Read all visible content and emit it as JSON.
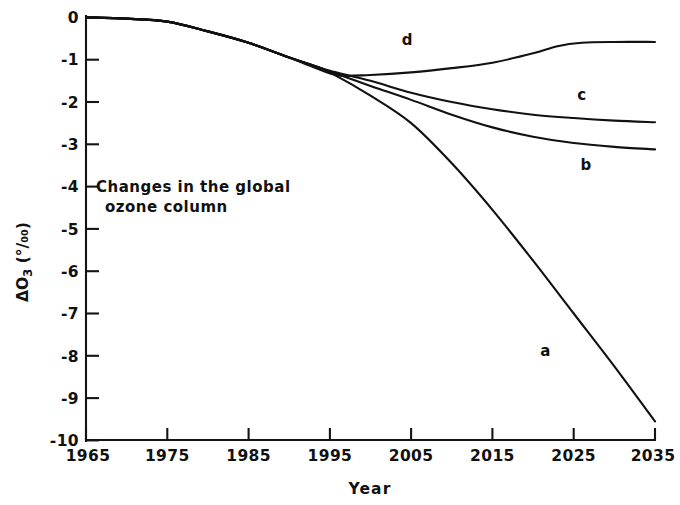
{
  "chart_data": {
    "type": "line",
    "title": "",
    "annotation": {
      "line1": "Changes in the global",
      "line2": "ozone column"
    },
    "xlabel": "Year",
    "ylabel": "ΔO3 (%)",
    "ylabel_parts": {
      "delta": "ΔO",
      "sub": "3",
      "unit": "(°/₀₀)",
      "unit_plain": "(%)"
    },
    "xlim": [
      1965,
      2035
    ],
    "ylim": [
      -10,
      0
    ],
    "xticks": [
      1965,
      1975,
      1985,
      1995,
      2005,
      2015,
      2025,
      2035
    ],
    "xtick_labels": [
      "1965",
      "1975",
      "1985",
      "1995",
      "2005",
      "2015",
      "2025",
      "2035"
    ],
    "yticks": [
      0,
      -1,
      -2,
      -3,
      -4,
      -5,
      -6,
      -7,
      -8,
      -9,
      -10
    ],
    "ytick_labels": [
      "0",
      "-1",
      "-2",
      "-3",
      "-4",
      "-5",
      "-6",
      "-7",
      "-8",
      "-9",
      "-10"
    ],
    "grid": false,
    "legend": "inline-curve-labels",
    "series": [
      {
        "name": "a",
        "label": "a",
        "label_x": 2021.5,
        "label_y": -8.0,
        "x": [
          1965,
          1970,
          1975,
          1980,
          1985,
          1990,
          1993,
          1995,
          2000,
          2005,
          2010,
          2015,
          2020,
          2025,
          2030,
          2035
        ],
        "y": [
          0.0,
          -0.03,
          -0.1,
          -0.33,
          -0.6,
          -0.95,
          -1.14,
          -1.3,
          -1.85,
          -2.5,
          -3.45,
          -4.55,
          -5.75,
          -7.0,
          -8.25,
          -9.55
        ]
      },
      {
        "name": "b",
        "label": "b",
        "label_x": 2026.5,
        "label_y": -3.6,
        "x": [
          1965,
          1970,
          1975,
          1980,
          1985,
          1990,
          1993,
          1995,
          2000,
          2005,
          2010,
          2015,
          2020,
          2025,
          2030,
          2035
        ],
        "y": [
          0.0,
          -0.03,
          -0.1,
          -0.33,
          -0.6,
          -0.95,
          -1.14,
          -1.28,
          -1.62,
          -1.95,
          -2.3,
          -2.6,
          -2.82,
          -2.97,
          -3.06,
          -3.12
        ]
      },
      {
        "name": "c",
        "label": "c",
        "label_x": 2026.0,
        "label_y": -1.95,
        "x": [
          1965,
          1970,
          1975,
          1980,
          1985,
          1990,
          1993,
          1995,
          2000,
          2005,
          2010,
          2015,
          2020,
          2025,
          2030,
          2035
        ],
        "y": [
          0.0,
          -0.03,
          -0.1,
          -0.33,
          -0.6,
          -0.95,
          -1.14,
          -1.26,
          -1.5,
          -1.78,
          -2.0,
          -2.17,
          -2.3,
          -2.38,
          -2.44,
          -2.48
        ]
      },
      {
        "name": "d",
        "label": "d",
        "label_x": 2004.5,
        "label_y": -0.66,
        "x": [
          1965,
          1970,
          1975,
          1980,
          1985,
          1990,
          1993,
          1996,
          2000,
          2005,
          2010,
          2015,
          2020,
          2023,
          2026,
          2030,
          2035
        ],
        "y": [
          0.0,
          -0.03,
          -0.1,
          -0.33,
          -0.6,
          -0.95,
          -1.18,
          -1.37,
          -1.36,
          -1.3,
          -1.2,
          -1.07,
          -0.85,
          -0.68,
          -0.6,
          -0.58,
          -0.58
        ]
      }
    ]
  }
}
